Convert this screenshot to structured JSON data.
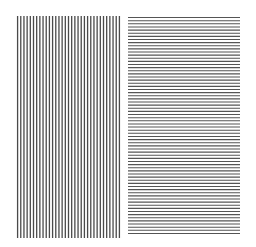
{
  "figure": {
    "background_color": "#ffffff",
    "panels": [
      {
        "id": "vertical-grating",
        "orientation": "vertical",
        "line_count": 33,
        "line_color": "#4a4a4a",
        "line_width": 1.3,
        "bbox": {
          "x": 16,
          "y": 16,
          "width": 105,
          "height": 222
        }
      },
      {
        "id": "horizontal-grating",
        "orientation": "horizontal",
        "line_count": 70,
        "line_color": "#555555",
        "line_width": 1.1,
        "bbox": {
          "x": 128,
          "y": 16,
          "width": 112,
          "height": 219
        }
      }
    ]
  }
}
